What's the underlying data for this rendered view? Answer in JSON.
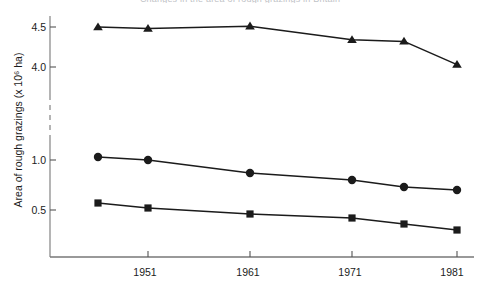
{
  "chart_data": {
    "type": "line",
    "title": "Changes in the area of rough grazings in Britain",
    "xlabel": "",
    "ylabel": "Area of rough grazings (x 10⁶ ha)",
    "x": [
      1946,
      1951,
      1961,
      1971,
      1976,
      1981
    ],
    "xtick_labels": [
      "1951",
      "1961",
      "1971",
      "1981"
    ],
    "xtick_values": [
      1951,
      1961,
      1971,
      1981
    ],
    "ytick_labels": [
      "4.5",
      "4.0",
      "1.0",
      "0.5"
    ],
    "ytick_values": [
      4.5,
      4.0,
      1.0,
      0.5
    ],
    "axis_break": true,
    "grid": false,
    "legend": "none",
    "series": [
      {
        "name": "Scotland",
        "marker": "triangle",
        "color": "#1b1b1b",
        "values": [
          4.5,
          4.48,
          4.51,
          4.34,
          4.32,
          4.03
        ]
      },
      {
        "name": "England",
        "marker": "circle",
        "color": "#1b1b1b",
        "values": [
          1.03,
          1.0,
          0.87,
          0.8,
          0.73,
          0.7
        ]
      },
      {
        "name": "Wales",
        "marker": "square",
        "color": "#1b1b1b",
        "values": [
          0.57,
          0.52,
          0.46,
          0.42,
          0.36,
          0.3
        ]
      }
    ]
  },
  "axis": {
    "tick_color": "#555555",
    "spine_color": "#777777",
    "line_color": "#1b1b1b"
  }
}
